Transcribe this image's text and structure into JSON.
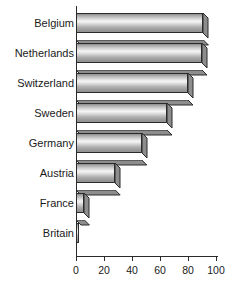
{
  "chart_data": {
    "type": "bar",
    "orientation": "horizontal",
    "title": "",
    "subtitle": "",
    "xlabel": "",
    "ylabel": "",
    "categories": [
      "Belgium",
      "Netherlands",
      "Switzerland",
      "Sweden",
      "Germany",
      "Austria",
      "France",
      "Britain"
    ],
    "values": [
      91,
      90,
      80,
      65,
      47,
      28,
      6,
      2
    ],
    "xlim": [
      0,
      100
    ],
    "xticks": [
      0,
      20,
      40,
      60,
      80,
      100
    ],
    "xtick_labels": [
      "0",
      "20",
      "40",
      "60",
      "80",
      "100"
    ],
    "grid": false,
    "legend": null,
    "style": "3d-gradient-bars",
    "bar_color": "#d8d8d8",
    "bar_border_color": "#2b2b2b",
    "axis_color": "#2b2b2b",
    "background": "#ffffff"
  },
  "axis": {
    "x": {
      "ticks": [
        {
          "value": 0,
          "label": "0"
        },
        {
          "value": 20,
          "label": "20"
        },
        {
          "value": 40,
          "label": "40"
        },
        {
          "value": 60,
          "label": "60"
        },
        {
          "value": 80,
          "label": "80"
        },
        {
          "value": 100,
          "label": "100"
        }
      ]
    }
  },
  "rows": [
    {
      "label": "Belgium",
      "value": 91
    },
    {
      "label": "Netherlands",
      "value": 90
    },
    {
      "label": "Switzerland",
      "value": 80
    },
    {
      "label": "Sweden",
      "value": 65
    },
    {
      "label": "Germany",
      "value": 47
    },
    {
      "label": "Austria",
      "value": 28
    },
    {
      "label": "France",
      "value": 6
    },
    {
      "label": "Britain",
      "value": 2
    }
  ]
}
